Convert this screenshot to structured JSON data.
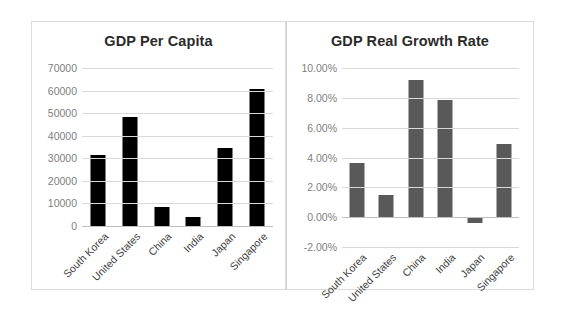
{
  "charts": [
    {
      "title": "GDP Per Capita",
      "bar_color": "#000000",
      "yticks": [
        "70000",
        "60000",
        "50000",
        "40000",
        "30000",
        "20000",
        "10000",
        "0"
      ],
      "categories": [
        "South Korea",
        "United States",
        "China",
        "India",
        "Japan",
        "Singapore"
      ]
    },
    {
      "title": "GDP Real Growth Rate",
      "bar_color": "#595959",
      "yticks": [
        "10.00%",
        "8.00%",
        "6.00%",
        "4.00%",
        "2.00%",
        "0.00%",
        "-2.00%"
      ],
      "categories": [
        "South Korea",
        "United States",
        "China",
        "India",
        "Japan",
        "Singapore"
      ]
    }
  ],
  "chart_data": [
    {
      "type": "bar",
      "title": "GDP Per Capita",
      "xlabel": "",
      "ylabel": "",
      "categories": [
        "South Korea",
        "United States",
        "China",
        "India",
        "Japan",
        "Singapore"
      ],
      "values": [
        31500,
        48200,
        8500,
        3800,
        34400,
        60500
      ],
      "ylim": [
        0,
        70000
      ],
      "ytick_step": 10000,
      "ytick_labels": [
        "0",
        "10000",
        "20000",
        "30000",
        "40000",
        "50000",
        "60000",
        "70000"
      ],
      "grid": true,
      "legend": "none",
      "bar_color": "#000000"
    },
    {
      "type": "bar",
      "title": "GDP Real Growth Rate",
      "xlabel": "",
      "ylabel": "",
      "categories": [
        "South Korea",
        "United States",
        "China",
        "India",
        "Japan",
        "Singapore"
      ],
      "values": [
        3.6,
        1.5,
        9.2,
        7.85,
        -0.4,
        4.9
      ],
      "value_unit": "percent",
      "ylim": [
        -2,
        10
      ],
      "ytick_step": 2,
      "ytick_labels": [
        "-2.00%",
        "0.00%",
        "2.00%",
        "4.00%",
        "6.00%",
        "8.00%",
        "10.00%"
      ],
      "grid": true,
      "legend": "none",
      "bar_color": "#595959"
    }
  ]
}
